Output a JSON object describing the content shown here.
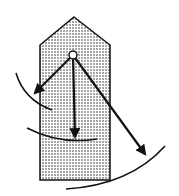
{
  "diagram": {
    "title": "",
    "colors": {
      "background": "#ffffff",
      "stroke": "#111111",
      "stipple": "#222222"
    },
    "shape": {
      "type": "pentagon",
      "points": [
        [
          74,
          17
        ],
        [
          110,
          45
        ],
        [
          110,
          180
        ],
        [
          40,
          180
        ],
        [
          40,
          45
        ]
      ]
    },
    "pivot": {
      "cx": 73,
      "cy": 55,
      "r": 4
    },
    "arrows": [
      {
        "name": "left",
        "from": [
          73,
          55
        ],
        "to": [
          33,
          95
        ]
      },
      {
        "name": "down",
        "from": [
          73,
          55
        ],
        "to": [
          75,
          140
        ]
      },
      {
        "name": "right",
        "from": [
          73,
          55
        ],
        "to": [
          147,
          157
        ]
      }
    ],
    "arcs": [
      {
        "name": "left",
        "path": "M16 73 Q24 100 52 110"
      },
      {
        "name": "middle",
        "path": "M27 128 Q60 145 97 139"
      },
      {
        "name": "right",
        "path": "M66 189 Q130 185 165 146"
      }
    ]
  }
}
